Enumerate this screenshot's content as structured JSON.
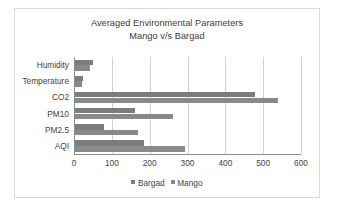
{
  "chart_data": {
    "type": "bar",
    "orientation": "horizontal",
    "title": "Averaged Environmental Parameters",
    "subtitle": "Mango v/s Bargad",
    "xlabel": "",
    "ylabel": "",
    "xlim": [
      0,
      600
    ],
    "xticks": [
      0,
      100,
      200,
      300,
      400,
      500,
      600
    ],
    "grid": true,
    "legend_position": "bottom",
    "categories": [
      "Humidity",
      "Temperature",
      "CO2",
      "PM10",
      "PM2.5",
      "AQI"
    ],
    "series": [
      {
        "name": "Bargad",
        "color": "#7c7c7c",
        "values": [
          48,
          20,
          476,
          159,
          77,
          182
        ]
      },
      {
        "name": "Mango",
        "color": "#898989",
        "values": [
          40,
          18,
          537,
          259,
          167,
          291
        ]
      }
    ]
  },
  "legend": {
    "items": [
      {
        "label": "Bargad"
      },
      {
        "label": "Mango"
      }
    ]
  },
  "colors": {
    "frame_border": "#d9d9d9",
    "gridline": "#d0d0d0",
    "axis": "#8c8c8c",
    "text": "#3f3f3f",
    "background": "#ffffff"
  }
}
